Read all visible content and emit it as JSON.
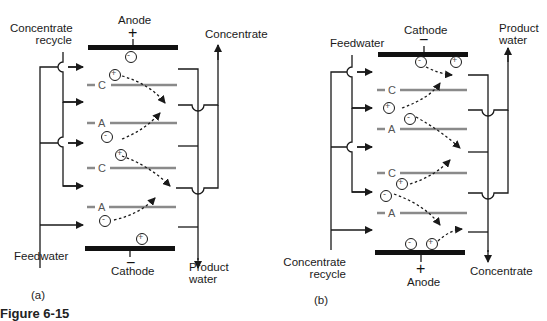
{
  "figure": {
    "caption_partial": "Figure 6-15",
    "panels": [
      {
        "id": "a",
        "label": "(a)",
        "top_electrode": {
          "name": "Anode",
          "sign": "+",
          "ion": "-"
        },
        "bottom_electrode": {
          "name": "Cathode",
          "sign": "−",
          "ion": "+"
        },
        "inlet_top_label": [
          "Concentrate",
          "recycle"
        ],
        "inlet_bottom_label": "Feedwater",
        "outlet_top_label": "Concentrate",
        "outlet_bottom_label": [
          "Product",
          "water"
        ],
        "membranes": [
          "C",
          "A",
          "C",
          "A"
        ],
        "ions": [
          "+",
          "-",
          "+",
          "-"
        ]
      },
      {
        "id": "b",
        "label": "(b)",
        "top_electrode": {
          "name": "Cathode",
          "sign": "−",
          "ions": [
            "-",
            "+"
          ]
        },
        "bottom_electrode": {
          "name": "Anode",
          "sign": "+",
          "ions": [
            "-",
            "+"
          ]
        },
        "inlet_top_label": "Feedwater",
        "inlet_bottom_label": [
          "Concentrate",
          "recycle"
        ],
        "outlet_top_label": [
          "Product",
          "water"
        ],
        "outlet_bottom_label": "Concentrate",
        "membranes": [
          "C",
          "A",
          "C",
          "A"
        ],
        "ions": [
          "+",
          "-",
          "+",
          "-"
        ]
      }
    ],
    "colors": {
      "line": "#1a1a1a",
      "membrane": "#8a8a8a",
      "electrode": "#111111"
    }
  }
}
